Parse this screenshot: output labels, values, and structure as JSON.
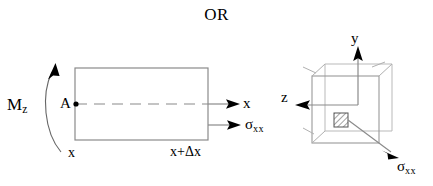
{
  "figure": {
    "title": "OR",
    "background_color": "#ffffff",
    "stroke_color": "#000000",
    "line_color": "#808080"
  },
  "beam": {
    "moment_label_base": "M",
    "moment_label_sub": "z",
    "point_label": "A",
    "left_station": "x",
    "right_station": "x+Δx",
    "axis_label": "x",
    "stress_label_base": "σ",
    "stress_label_sub": "xx",
    "icons": {
      "moment_arc": "curved-moment-arrow-icon",
      "axis_arrow": "right-arrow-icon",
      "stress_arrow": "right-arrow-icon",
      "point_marker": "dot-marker-icon",
      "centerline": "dashed-centerline-icon"
    }
  },
  "cube": {
    "y_axis_label": "y",
    "z_axis_label": "z",
    "stress_label_base": "σ",
    "stress_label_sub": "xx",
    "icons": {
      "y_arrow": "up-arrow-icon",
      "z_arrow": "left-arrow-icon",
      "stress_arrow": "diagonal-arrow-icon",
      "hatched_area": "hatched-square-icon",
      "cube_body": "cube-icon"
    }
  }
}
